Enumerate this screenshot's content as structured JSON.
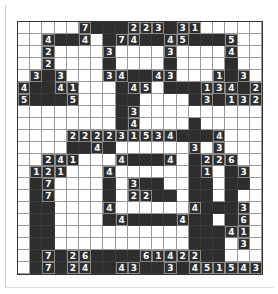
{
  "puzzle": {
    "type": "grid-puzzle",
    "cols": 20,
    "rows": 21,
    "colors": {
      "filled": "#2e2e2e",
      "empty": "#ffffff",
      "grid_line": "#999999",
      "number": "#ffffff"
    },
    "filled_rows": [
      [
        5,
        6,
        7,
        8,
        9,
        10,
        11,
        12,
        13,
        14
      ],
      [
        2,
        3,
        4,
        5,
        7,
        8,
        9,
        10,
        11,
        12,
        13,
        14,
        15,
        16,
        17
      ],
      [
        2,
        7,
        12,
        17
      ],
      [
        2,
        7,
        12,
        17
      ],
      [
        1,
        2,
        3,
        7,
        8,
        9,
        10,
        11,
        12,
        16,
        17,
        18
      ],
      [
        0,
        1,
        2,
        3,
        4,
        8,
        9,
        12,
        13,
        14,
        15,
        16,
        17,
        18,
        19
      ],
      [
        0,
        1,
        2,
        3,
        4,
        8,
        9,
        14,
        15,
        16,
        17,
        18,
        19
      ],
      [
        8,
        9
      ],
      [
        8,
        9,
        14
      ],
      [
        4,
        5,
        6,
        7,
        8,
        9,
        10,
        11,
        12,
        13,
        14,
        15,
        16
      ],
      [
        4,
        5,
        6,
        7,
        14,
        16
      ],
      [
        2,
        3,
        4,
        8,
        9,
        10,
        11,
        12,
        14,
        15,
        16,
        17
      ],
      [
        1,
        2,
        3,
        7,
        14,
        15,
        17,
        18
      ],
      [
        1,
        2,
        7,
        9,
        10,
        11,
        14,
        15,
        17,
        18
      ],
      [
        1,
        2,
        7,
        11,
        12,
        14,
        15,
        17
      ],
      [
        1,
        2,
        7,
        14,
        15,
        16,
        17
      ],
      [
        1,
        2,
        7,
        8,
        9,
        10,
        11,
        12,
        13,
        14,
        15,
        17
      ],
      [
        1,
        2,
        14,
        15,
        16,
        17
      ],
      [
        1,
        2,
        14,
        15,
        16
      ],
      [
        1,
        2,
        3,
        4,
        5,
        6,
        7,
        8,
        9,
        10,
        11,
        12,
        13,
        14,
        15,
        16
      ],
      [
        1,
        2,
        3,
        4,
        5,
        6,
        7,
        8,
        9,
        10,
        11,
        12,
        13,
        14,
        15,
        16,
        17
      ]
    ],
    "numbers": [
      {
        "r": 0,
        "c": 5,
        "v": "7"
      },
      {
        "r": 0,
        "c": 9,
        "v": "2"
      },
      {
        "r": 0,
        "c": 10,
        "v": "2"
      },
      {
        "r": 0,
        "c": 11,
        "v": "3"
      },
      {
        "r": 0,
        "c": 13,
        "v": "3"
      },
      {
        "r": 0,
        "c": 14,
        "v": "1"
      },
      {
        "r": 1,
        "c": 2,
        "v": "4"
      },
      {
        "r": 1,
        "c": 5,
        "v": "4"
      },
      {
        "r": 1,
        "c": 8,
        "v": "7"
      },
      {
        "r": 1,
        "c": 9,
        "v": "4"
      },
      {
        "r": 1,
        "c": 12,
        "v": "4"
      },
      {
        "r": 1,
        "c": 13,
        "v": "5"
      },
      {
        "r": 1,
        "c": 17,
        "v": "5"
      },
      {
        "r": 2,
        "c": 2,
        "v": "2"
      },
      {
        "r": 2,
        "c": 7,
        "v": "3"
      },
      {
        "r": 2,
        "c": 12,
        "v": "3"
      },
      {
        "r": 2,
        "c": 17,
        "v": "4"
      },
      {
        "r": 3,
        "c": 2,
        "v": "2"
      },
      {
        "r": 4,
        "c": 1,
        "v": "3"
      },
      {
        "r": 4,
        "c": 3,
        "v": "3"
      },
      {
        "r": 4,
        "c": 7,
        "v": "3"
      },
      {
        "r": 4,
        "c": 8,
        "v": "4"
      },
      {
        "r": 4,
        "c": 11,
        "v": "4"
      },
      {
        "r": 4,
        "c": 12,
        "v": "3"
      },
      {
        "r": 4,
        "c": 16,
        "v": "1"
      },
      {
        "r": 4,
        "c": 18,
        "v": "3"
      },
      {
        "r": 5,
        "c": 0,
        "v": "4"
      },
      {
        "r": 5,
        "c": 3,
        "v": "4"
      },
      {
        "r": 5,
        "c": 4,
        "v": "1"
      },
      {
        "r": 5,
        "c": 9,
        "v": "4"
      },
      {
        "r": 5,
        "c": 10,
        "v": "5"
      },
      {
        "r": 5,
        "c": 15,
        "v": "1"
      },
      {
        "r": 5,
        "c": 16,
        "v": "3"
      },
      {
        "r": 5,
        "c": 17,
        "v": "4"
      },
      {
        "r": 5,
        "c": 19,
        "v": "2"
      },
      {
        "r": 6,
        "c": 0,
        "v": "5"
      },
      {
        "r": 6,
        "c": 4,
        "v": "5"
      },
      {
        "r": 6,
        "c": 15,
        "v": "3"
      },
      {
        "r": 6,
        "c": 17,
        "v": "1"
      },
      {
        "r": 6,
        "c": 18,
        "v": "3"
      },
      {
        "r": 6,
        "c": 19,
        "v": "2"
      },
      {
        "r": 7,
        "c": 9,
        "v": "3"
      },
      {
        "r": 8,
        "c": 9,
        "v": "4"
      },
      {
        "r": 9,
        "c": 4,
        "v": "2"
      },
      {
        "r": 9,
        "c": 5,
        "v": "2"
      },
      {
        "r": 9,
        "c": 6,
        "v": "2"
      },
      {
        "r": 9,
        "c": 7,
        "v": "2"
      },
      {
        "r": 9,
        "c": 8,
        "v": "3"
      },
      {
        "r": 9,
        "c": 9,
        "v": "1"
      },
      {
        "r": 9,
        "c": 10,
        "v": "5"
      },
      {
        "r": 9,
        "c": 11,
        "v": "3"
      },
      {
        "r": 9,
        "c": 12,
        "v": "4"
      },
      {
        "r": 9,
        "c": 16,
        "v": "4"
      },
      {
        "r": 10,
        "c": 6,
        "v": "4"
      },
      {
        "r": 10,
        "c": 14,
        "v": "3"
      },
      {
        "r": 10,
        "c": 16,
        "v": "3"
      },
      {
        "r": 11,
        "c": 2,
        "v": "2"
      },
      {
        "r": 11,
        "c": 3,
        "v": "4"
      },
      {
        "r": 11,
        "c": 4,
        "v": "1"
      },
      {
        "r": 11,
        "c": 8,
        "v": "4"
      },
      {
        "r": 11,
        "c": 12,
        "v": "4"
      },
      {
        "r": 11,
        "c": 15,
        "v": "2"
      },
      {
        "r": 11,
        "c": 16,
        "v": "2"
      },
      {
        "r": 11,
        "c": 17,
        "v": "6"
      },
      {
        "r": 12,
        "c": 1,
        "v": "1"
      },
      {
        "r": 12,
        "c": 2,
        "v": "2"
      },
      {
        "r": 12,
        "c": 3,
        "v": "1"
      },
      {
        "r": 12,
        "c": 7,
        "v": "4"
      },
      {
        "r": 12,
        "c": 15,
        "v": "1"
      },
      {
        "r": 12,
        "c": 18,
        "v": "3"
      },
      {
        "r": 13,
        "c": 2,
        "v": "7"
      },
      {
        "r": 13,
        "c": 9,
        "v": "3"
      },
      {
        "r": 14,
        "c": 2,
        "v": "7"
      },
      {
        "r": 14,
        "c": 9,
        "v": "2"
      },
      {
        "r": 14,
        "c": 10,
        "v": "2"
      },
      {
        "r": 15,
        "c": 7,
        "v": "4"
      },
      {
        "r": 15,
        "c": 14,
        "v": "4"
      },
      {
        "r": 15,
        "c": 18,
        "v": "3"
      },
      {
        "r": 16,
        "c": 8,
        "v": "4"
      },
      {
        "r": 16,
        "c": 13,
        "v": "4"
      },
      {
        "r": 16,
        "c": 18,
        "v": "6"
      },
      {
        "r": 17,
        "c": 17,
        "v": "4"
      },
      {
        "r": 17,
        "c": 18,
        "v": "1"
      },
      {
        "r": 18,
        "c": 18,
        "v": "3"
      },
      {
        "r": 19,
        "c": 2,
        "v": "7"
      },
      {
        "r": 19,
        "c": 4,
        "v": "2"
      },
      {
        "r": 19,
        "c": 5,
        "v": "6"
      },
      {
        "r": 19,
        "c": 10,
        "v": "6"
      },
      {
        "r": 19,
        "c": 11,
        "v": "1"
      },
      {
        "r": 19,
        "c": 12,
        "v": "4"
      },
      {
        "r": 19,
        "c": 13,
        "v": "2"
      },
      {
        "r": 19,
        "c": 14,
        "v": "2"
      },
      {
        "r": 20,
        "c": 2,
        "v": "7"
      },
      {
        "r": 20,
        "c": 4,
        "v": "2"
      },
      {
        "r": 20,
        "c": 5,
        "v": "4"
      },
      {
        "r": 20,
        "c": 8,
        "v": "4"
      },
      {
        "r": 20,
        "c": 9,
        "v": "3"
      },
      {
        "r": 20,
        "c": 12,
        "v": "3"
      },
      {
        "r": 20,
        "c": 14,
        "v": "4"
      },
      {
        "r": 20,
        "c": 15,
        "v": "5"
      },
      {
        "r": 20,
        "c": 16,
        "v": "1"
      },
      {
        "r": 20,
        "c": 17,
        "v": "5"
      },
      {
        "r": 20,
        "c": 18,
        "v": "4"
      },
      {
        "r": 20,
        "c": 19,
        "v": "3"
      }
    ]
  }
}
